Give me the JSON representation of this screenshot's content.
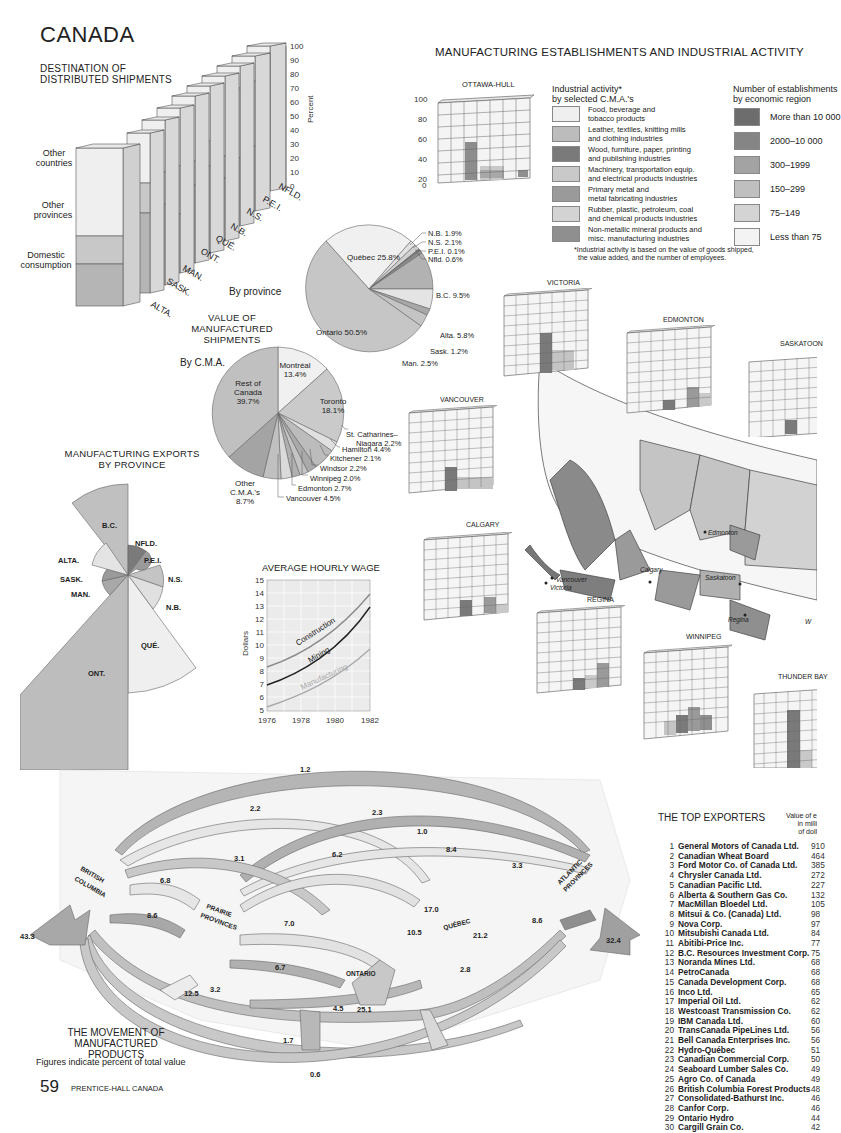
{
  "page": {
    "title": "CANADA",
    "page_number": "59",
    "publisher": "PRENTICE-HALL CANADA"
  },
  "colors": {
    "lightest": "#f0f0f0",
    "light": "#d9d9d9",
    "mid": "#bdbdbd",
    "dark": "#9a9a9a",
    "darker": "#7f7f7f",
    "darkest": "#666666"
  },
  "destination": {
    "title_line1": "DESTINATION OF",
    "title_line2": "DISTRIBUTED SHIPMENTS",
    "labels": {
      "other_countries_1": "Other",
      "other_countries_2": "countries",
      "other_provinces_1": "Other",
      "other_provinces_2": "provinces",
      "domestic_1": "Domestic",
      "domestic_2": "consumption"
    },
    "axis_label": "Percent"
  },
  "establishments": {
    "title": "MANUFACTURING ESTABLISHMENTS AND INDUSTRIAL ACTIVITY",
    "ottawa_title": "OTTAWA-HULL",
    "percent_label": "Percent",
    "activity_legend_title_1": "Industrial activity*",
    "activity_legend_title_2": "by selected C.M.A.'s",
    "activity_legend": [
      {
        "l1": "Food, beverage and",
        "l2": "tobacco products",
        "color": "#efefef"
      },
      {
        "l1": "Leather, textiles, knitting mills",
        "l2": "and clothing industries",
        "color": "#bcbcbc"
      },
      {
        "l1": "Wood, furniture, paper, printing",
        "l2": "and publishing industries",
        "color": "#7a7a7a"
      },
      {
        "l1": "Machinery, transportation equip.",
        "l2": "and electrical products industries",
        "color": "#c9c9c9"
      },
      {
        "l1": "Primary metal and",
        "l2": "metal fabricating industries",
        "color": "#9a9a9a"
      },
      {
        "l1": "Rubber, plastic, petroleum, coal",
        "l2": "and chemical products industries",
        "color": "#d3d3d3"
      },
      {
        "l1": "Non-metallic mineral products and",
        "l2": "misc. manufacturing industries",
        "color": "#8f8f8f"
      }
    ],
    "est_legend_title_1": "Number of establishments",
    "est_legend_title_2": "by economic region",
    "est_legend": [
      {
        "label": "More than 10 000",
        "color": "#6d6d6d"
      },
      {
        "label": "2000–10 000",
        "color": "#858585"
      },
      {
        "label": "300–1999",
        "color": "#a3a3a3"
      },
      {
        "label": "150–299",
        "color": "#bfbfbf"
      },
      {
        "label": "75–149",
        "color": "#d4d4d4"
      },
      {
        "label": "Less than 75",
        "color": "#f3f3f3"
      }
    ],
    "footnote_1": "*Industrial activity is based on the value of goods shipped,",
    "footnote_2": "the value added, and the number of employees.",
    "cities": [
      "VICTORIA",
      "EDMONTON",
      "SASKATOON",
      "VANCOUVER",
      "CALGARY",
      "REGINA",
      "WINNIPEG",
      "THUNDER BAY"
    ],
    "map_labels": [
      "Edmonton",
      "Vancouver",
      "Victoria",
      "Calgary",
      "Saskatoon",
      "Regina",
      "W"
    ]
  },
  "value_shipments": {
    "title_1": "VALUE OF",
    "title_2": "MANUFACTURED",
    "title_3": "SHIPMENTS",
    "by_province_label": "By province",
    "by_cma_label": "By C.M.A."
  },
  "exports_title_1": "MANUFACTURING EXPORTS",
  "exports_title_2": "BY PROVINCE",
  "wage": {
    "title": "AVERAGE HOURLY WAGE",
    "ylabel": "Dollars"
  },
  "movement": {
    "title_1": "THE MOVEMENT OF",
    "title_2": "MANUFACTURED PRODUCTS",
    "note": "Figures indicate percent of total value",
    "regions": [
      "BRITISH COLUMBIA",
      "PRAIRIE PROVINCES",
      "ONTARIO",
      "QUÉBEC",
      "ATLANTIC PROVINCES"
    ]
  },
  "exporters": {
    "title": "THE TOP EXPORTERS",
    "value_header_1": "Value of e",
    "value_header_2": "in milli",
    "value_header_3": "of doll",
    "rows": [
      {
        "rank": "1",
        "name": "General Motors of Canada Ltd.",
        "value": "910"
      },
      {
        "rank": "2",
        "name": "Canadian Wheat Board",
        "value": "464"
      },
      {
        "rank": "3",
        "name": "Ford Motor Co. of Canada Ltd.",
        "value": "385"
      },
      {
        "rank": "4",
        "name": "Chrysler Canada Ltd.",
        "value": "272"
      },
      {
        "rank": "5",
        "name": "Canadian Pacific Ltd.",
        "value": "227"
      },
      {
        "rank": "6",
        "name": "Alberta & Southern Gas Co.",
        "value": "132"
      },
      {
        "rank": "7",
        "name": "MacMillan Bloedel Ltd.",
        "value": "105"
      },
      {
        "rank": "8",
        "name": "Mitsui & Co. (Canada) Ltd.",
        "value": "98"
      },
      {
        "rank": "9",
        "name": "Nova Corp.",
        "value": "97"
      },
      {
        "rank": "10",
        "name": "Mitsubishi Canada Ltd.",
        "value": "84"
      },
      {
        "rank": "11",
        "name": "Abitibi-Price Inc.",
        "value": "77"
      },
      {
        "rank": "12",
        "name": "B.C. Resources Investment Corp.",
        "value": "75"
      },
      {
        "rank": "13",
        "name": "Noranda Mines Ltd.",
        "value": "68"
      },
      {
        "rank": "14",
        "name": "PetroCanada",
        "value": "68"
      },
      {
        "rank": "15",
        "name": "Canada Development Corp.",
        "value": "68"
      },
      {
        "rank": "16",
        "name": "Inco Ltd.",
        "value": "65"
      },
      {
        "rank": "17",
        "name": "Imperial Oil Ltd.",
        "value": "62"
      },
      {
        "rank": "18",
        "name": "Westcoast Transmission Co.",
        "value": "62"
      },
      {
        "rank": "19",
        "name": "IBM Canada Ltd.",
        "value": "60"
      },
      {
        "rank": "20",
        "name": "TransCanada PipeLines Ltd.",
        "value": "56"
      },
      {
        "rank": "21",
        "name": "Bell Canada Enterprises Inc.",
        "value": "56"
      },
      {
        "rank": "22",
        "name": "Hydro-Québec",
        "value": "51"
      },
      {
        "rank": "23",
        "name": "Canadian Commercial Corp.",
        "value": "50"
      },
      {
        "rank": "24",
        "name": "Seaboard Lumber Sales Co.",
        "value": "49"
      },
      {
        "rank": "25",
        "name": "Agro Co. of Canada",
        "value": "49"
      },
      {
        "rank": "26",
        "name": "British Columbia Forest Products",
        "value": "48"
      },
      {
        "rank": "27",
        "name": "Consolidated-Bathurst Inc.",
        "value": "46"
      },
      {
        "rank": "28",
        "name": "Canfor Corp.",
        "value": "46"
      },
      {
        "rank": "29",
        "name": "Ontario Hydro",
        "value": "44"
      },
      {
        "rank": "30",
        "name": "Cargill Grain Co.",
        "value": "42"
      }
    ]
  },
  "chart_data": [
    {
      "type": "bar",
      "title": "Destination of Distributed Shipments",
      "stacked": true,
      "categories": [
        "B.C.",
        "ALTA.",
        "SASK.",
        "MAN.",
        "ONT.",
        "QUÉ.",
        "N.B.",
        "N.S.",
        "P.E.I.",
        "NFLD."
      ],
      "series": [
        {
          "name": "Domestic consumption",
          "values": [
            43,
            51,
            48,
            37,
            44,
            49,
            34,
            43,
            41,
            31
          ]
        },
        {
          "name": "Other provinces",
          "values": [
            13,
            19,
            20,
            29,
            14,
            15,
            14,
            43,
            44,
            10
          ]
        },
        {
          "name": "Other countries",
          "values": [
            44,
            30,
            32,
            34,
            42,
            36,
            52,
            14,
            15,
            59
          ]
        }
      ],
      "ylabel": "Percent",
      "ylim": [
        0,
        100
      ],
      "yticks": [
        0,
        10,
        20,
        30,
        40,
        50,
        60,
        70,
        80,
        90,
        100
      ]
    },
    {
      "type": "pie",
      "title": "Value of Manufactured Shipments — By province",
      "categories": [
        "Ontario",
        "Québec",
        "N.B.",
        "N.S.",
        "P.E.I.",
        "Nfld.",
        "B.C.",
        "Alta.",
        "Sask.",
        "Man."
      ],
      "values": [
        50.5,
        25.8,
        1.9,
        2.1,
        0.1,
        0.6,
        9.5,
        5.8,
        1.2,
        2.5
      ]
    },
    {
      "type": "pie",
      "title": "Value of Manufactured Shipments — By C.M.A.",
      "categories": [
        "Rest of Canada",
        "Montréal",
        "Toronto",
        "St. Catharines–Niagara",
        "Hamilton",
        "Kitchener",
        "Windsor",
        "Winnipeg",
        "Edmonton",
        "Vancouver",
        "Other C.M.A.'s"
      ],
      "values": [
        39.7,
        13.4,
        18.1,
        2.2,
        4.4,
        2.1,
        2.2,
        2.0,
        2.7,
        4.5,
        8.7
      ]
    },
    {
      "type": "pie",
      "title": "Manufacturing Exports by Province (polar area)",
      "categories": [
        "B.C.",
        "NFLD.",
        "P.E.I.",
        "N.S.",
        "N.B.",
        "QUÉ.",
        "ONT.",
        "MAN.",
        "SASK.",
        "ALTA."
      ],
      "values": [
        16,
        3,
        1,
        4,
        5,
        18,
        45,
        2,
        2,
        4
      ]
    },
    {
      "type": "line",
      "title": "AVERAGE HOURLY WAGE",
      "x": [
        1976,
        1977,
        1978,
        1979,
        1980,
        1981,
        1982
      ],
      "series": [
        {
          "name": "Construction",
          "values": [
            8.7,
            9.3,
            10.1,
            11.0,
            12.0,
            13.1,
            14.3
          ]
        },
        {
          "name": "Mining",
          "values": [
            7.3,
            8.0,
            8.8,
            9.7,
            10.7,
            11.9,
            13.3
          ]
        },
        {
          "name": "Manufacturing",
          "values": [
            5.6,
            6.2,
            6.8,
            7.5,
            8.2,
            8.9,
            9.8
          ]
        }
      ],
      "xlabel": "",
      "ylabel": "Dollars",
      "ylim": [
        5,
        15
      ],
      "xticks": [
        1976,
        1978,
        1980,
        1982
      ],
      "grid": true
    },
    {
      "type": "bar",
      "title": "Industrial activity — OTTAWA-HULL",
      "categories": [
        "Food",
        "Leather/textiles",
        "Wood/paper",
        "Machinery",
        "Primary metal",
        "Rubber/chem",
        "Non-metallic"
      ],
      "values": [
        5,
        0,
        47,
        22,
        25,
        0,
        25
      ],
      "ylabel": "Percent",
      "ylim": [
        0,
        100
      ]
    },
    {
      "type": "table",
      "title": "THE TOP EXPORTERS",
      "columns": [
        "Rank",
        "Company",
        "Value of exports (millions of dollars)"
      ],
      "rows_ref": "exporters.rows"
    },
    {
      "type": "table",
      "title": "THE MOVEMENT OF MANUFACTURED PRODUCTS",
      "note": "Figures indicate percent of total value",
      "flows": [
        {
          "label": "BC exports",
          "value": 43.3
        },
        {
          "label": "Atlantic exports",
          "value": 32.4
        },
        {
          "label": "Ontario→",
          "value": 25.1
        },
        {
          "label": "Québec",
          "value": 21.2
        },
        {
          "label": "Ontario↔Québec",
          "value": 17.0
        },
        {
          "label": "Prairie",
          "value": 12.5
        },
        {
          "label": "Ontario↔Québec",
          "value": 10.5
        },
        {
          "label": "BC→Prairie",
          "value": 8.6
        },
        {
          "label": "Québec↔Atlantic",
          "value": 8.6
        },
        {
          "label": "Québec→Atlantic",
          "value": 8.4
        },
        {
          "label": "Prairie→Ontario",
          "value": 7.0
        },
        {
          "label": "BC↔Prairie",
          "value": 6.8
        },
        {
          "label": "Ontario→Prairie",
          "value": 6.7
        },
        {
          "label": "",
          "value": 6.2
        },
        {
          "label": "",
          "value": 4.5
        },
        {
          "label": "",
          "value": 3.3
        },
        {
          "label": "",
          "value": 3.2
        },
        {
          "label": "",
          "value": 3.1
        },
        {
          "label": "",
          "value": 2.8
        },
        {
          "label": "",
          "value": 2.3
        },
        {
          "label": "",
          "value": 2.2
        },
        {
          "label": "",
          "value": 1.7
        },
        {
          "label": "",
          "value": 1.2
        },
        {
          "label": "",
          "value": 1.0
        },
        {
          "label": "",
          "value": 0.6
        }
      ]
    }
  ]
}
